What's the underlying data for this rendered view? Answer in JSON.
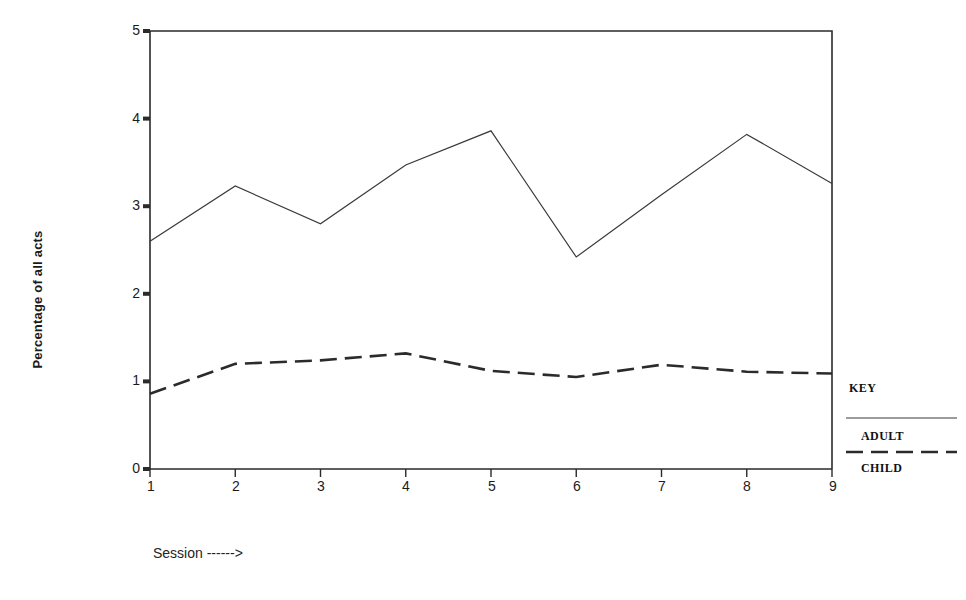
{
  "chart_data": {
    "type": "line",
    "title": "",
    "subtitle": "",
    "xlabel": "Session ------>",
    "ylabel": "Percentage of all acts",
    "categories": [
      1,
      2,
      3,
      4,
      5,
      6,
      7,
      8,
      9
    ],
    "x_tick_labels": [
      "1",
      "2",
      "3",
      "4",
      "5",
      "6",
      "7",
      "8",
      "9"
    ],
    "y_tick_labels": [
      "0",
      "1",
      "2",
      "3",
      "4",
      "5"
    ],
    "y_tick_values": [
      0,
      1,
      2,
      3,
      4,
      5
    ],
    "xlim": [
      1,
      9
    ],
    "ylim": [
      0,
      5
    ],
    "grid": false,
    "legend_position": "right",
    "legend_title": "KEY",
    "series": [
      {
        "name": "ADULT",
        "style": "solid",
        "values": [
          2.6,
          3.23,
          2.8,
          3.47,
          3.86,
          2.42,
          3.13,
          3.82,
          3.26
        ]
      },
      {
        "name": "CHILD",
        "style": "dashed",
        "values": [
          0.86,
          1.2,
          1.24,
          1.32,
          1.12,
          1.05,
          1.19,
          1.11,
          1.09
        ]
      }
    ]
  },
  "axes": {
    "y_label": "Percentage of all acts",
    "x_label": "Session ------>",
    "y_ticks": [
      {
        "label": "5",
        "value": 5
      },
      {
        "label": "4",
        "value": 4
      },
      {
        "label": "3",
        "value": 3
      },
      {
        "label": "2",
        "value": 2
      },
      {
        "label": "1",
        "value": 1
      },
      {
        "label": "0",
        "value": 0
      }
    ],
    "x_ticks": [
      {
        "label": "1",
        "value": 1
      },
      {
        "label": "2",
        "value": 2
      },
      {
        "label": "3",
        "value": 3
      },
      {
        "label": "4",
        "value": 4
      },
      {
        "label": "5",
        "value": 5
      },
      {
        "label": "6",
        "value": 6
      },
      {
        "label": "7",
        "value": 7
      },
      {
        "label": "8",
        "value": 8
      },
      {
        "label": "9",
        "value": 9
      }
    ]
  },
  "legend": {
    "title": "KEY",
    "entries": [
      {
        "label": "ADULT",
        "style": "solid"
      },
      {
        "label": "CHILD",
        "style": "dashed"
      }
    ]
  },
  "colors": {
    "ink": "#2b2b2b",
    "adult_line": "#3a3a3a",
    "child_line": "#2b2b2b",
    "background": "#ffffff"
  }
}
